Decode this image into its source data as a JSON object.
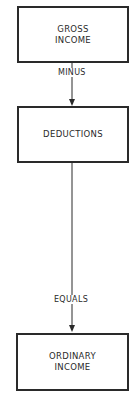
{
  "diagram": {
    "nodes": [
      {
        "id": "gross-income",
        "line1": "GROSS",
        "line2": "INCOME"
      },
      {
        "id": "deductions",
        "line1": "DEDUCTIONS",
        "line2": ""
      },
      {
        "id": "ordinary-income",
        "line1": "ORDINARY",
        "line2": "INCOME"
      }
    ],
    "edges": [
      {
        "from": "gross-income",
        "to": "deductions",
        "label": "MINUS"
      },
      {
        "from": "deductions",
        "to": "ordinary-income",
        "label": "EQUALS"
      }
    ]
  }
}
